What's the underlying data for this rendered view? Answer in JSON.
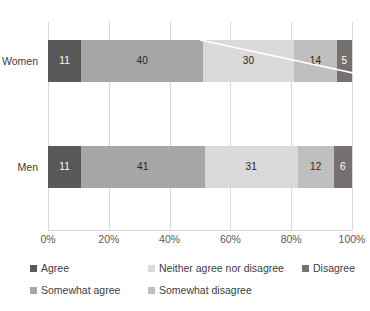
{
  "chart_data": {
    "type": "bar",
    "orientation": "horizontal",
    "stacked": true,
    "stacked_mode": "percent",
    "title": "",
    "subtitle": "",
    "xlabel": "",
    "ylabel": "",
    "categories": [
      "Women",
      "Men"
    ],
    "xlim": [
      0,
      100
    ],
    "xticks": [
      0,
      20,
      40,
      60,
      80,
      100
    ],
    "xtick_labels": [
      "0%",
      "20%",
      "40%",
      "60%",
      "80%",
      "100%"
    ],
    "grid": "vertical",
    "legend_position": "bottom",
    "series": [
      {
        "name": "Agree",
        "color": "#595959",
        "label_color": "#ffffff",
        "values": [
          11,
          11
        ],
        "value_labels": [
          "11",
          "11"
        ]
      },
      {
        "name": "Somewhat agree",
        "color": "#a6a6a6",
        "label_color": "#262626",
        "values": [
          40,
          41
        ],
        "value_labels": [
          "40",
          "41"
        ]
      },
      {
        "name": "Neither agree nor disagree",
        "color": "#d9d9d9",
        "label_color": "#262626",
        "values": [
          30,
          31
        ],
        "value_labels": [
          "30",
          "31"
        ]
      },
      {
        "name": "Somewhat disagree",
        "color": "#bfbfbf",
        "label_color": "#262626",
        "values": [
          14,
          12
        ],
        "value_labels": [
          "14",
          "12"
        ]
      },
      {
        "name": "Disagree",
        "color": "#767171",
        "label_color": "#ffffff",
        "values": [
          5,
          6
        ],
        "value_labels": [
          "5",
          "6"
        ]
      }
    ],
    "annotations": [
      {
        "name": "diagonal-streak",
        "type": "line",
        "color": "#ffffff",
        "note": "white diagonal artifact across Women bar"
      }
    ]
  },
  "axis": {
    "ticks": [
      {
        "label": "0%",
        "value": 0
      },
      {
        "label": "20%",
        "value": 20
      },
      {
        "label": "40%",
        "value": 40
      },
      {
        "label": "60%",
        "value": 60
      },
      {
        "label": "80%",
        "value": 80
      },
      {
        "label": "100%",
        "value": 100
      }
    ]
  },
  "legend": {
    "rows": [
      [
        {
          "label": "Agree",
          "color": "#595959",
          "left": 0
        },
        {
          "label": "Neither agree nor disagree",
          "color": "#d9d9d9",
          "left": 118
        },
        {
          "label": "Disagree",
          "color": "#767171",
          "left": 272
        }
      ],
      [
        {
          "label": "Somewhat agree",
          "color": "#a6a6a6",
          "left": 0
        },
        {
          "label": "Somewhat disagree",
          "color": "#bfbfbf",
          "left": 118
        }
      ]
    ]
  }
}
